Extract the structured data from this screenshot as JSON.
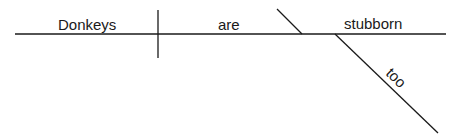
{
  "diagram": {
    "type": "sentence-diagram",
    "sentence": "Donkeys are stubborn too",
    "line_color": "#1a1a1a",
    "words": {
      "subject": "Donkeys",
      "verb": "are",
      "complement": "stubborn",
      "modifier": "too"
    },
    "roles": {
      "subject_label": "subject",
      "verb_label": "linking verb",
      "complement_label": "predicate adjective",
      "modifier_label": "adverb"
    }
  }
}
